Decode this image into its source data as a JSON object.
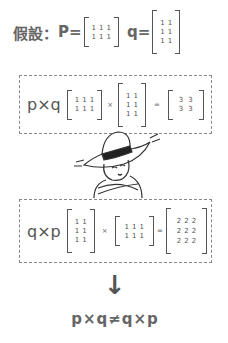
{
  "header": {
    "prefix": "假設：",
    "p_label": "P=",
    "q_label": "q=",
    "p_matrix": [
      [
        "1",
        "1",
        "1"
      ],
      [
        "1",
        "1",
        "1"
      ]
    ],
    "q_matrix": [
      [
        "1",
        "1"
      ],
      [
        "1",
        "1"
      ],
      [
        "1",
        "1"
      ]
    ]
  },
  "equation1": {
    "label": "p×q",
    "left": [
      [
        "1",
        "1",
        "1"
      ],
      [
        "1",
        "1",
        "1"
      ]
    ],
    "times": "×",
    "right": [
      [
        "1",
        "1"
      ],
      [
        "1",
        "1"
      ],
      [
        "1",
        "1"
      ]
    ],
    "equals": "=",
    "result": [
      [
        "3",
        "3"
      ],
      [
        "3",
        "3"
      ]
    ]
  },
  "illustration": {
    "description": "cartoon man in hat with crossed arms, puzzled"
  },
  "equation2": {
    "label": "q×p",
    "left": [
      [
        "1",
        "1"
      ],
      [
        "1",
        "1"
      ],
      [
        "1",
        "1"
      ]
    ],
    "times": "×",
    "right": [
      [
        "1",
        "1",
        "1"
      ],
      [
        "1",
        "1",
        "1"
      ]
    ],
    "equals": "=",
    "result": [
      [
        "2",
        "2",
        "2"
      ],
      [
        "2",
        "2",
        "2"
      ],
      [
        "2",
        "2",
        "2"
      ]
    ]
  },
  "conclusion": {
    "arrow": "↓",
    "text": "p×q≠q×p"
  },
  "colors": {
    "text": "#555555",
    "dashed_border": "#888888"
  }
}
